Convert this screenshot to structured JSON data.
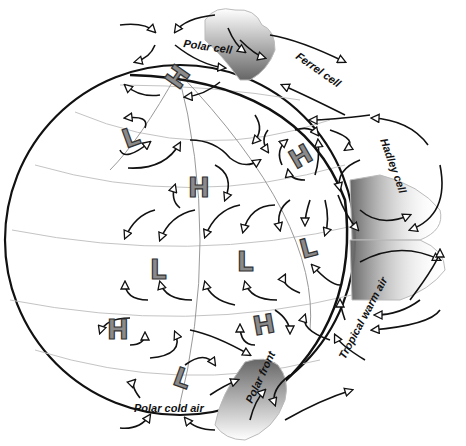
{
  "diagram": {
    "labels": {
      "polar_cell": "Polar cell",
      "ferrel_cell": "Ferrel cell",
      "hadley_cell": "Hadley cell",
      "tropical_warm_air": "Tropical warm air",
      "polar_front": "Polar front",
      "polar_cold_air": "Polar cold air"
    },
    "pressure_systems": [
      {
        "letter": "H",
        "x": 178,
        "y": 78,
        "rotate": -55
      },
      {
        "letter": "L",
        "x": 132,
        "y": 138,
        "rotate": -20
      },
      {
        "letter": "H",
        "x": 198,
        "y": 188,
        "rotate": 0
      },
      {
        "letter": "H",
        "x": 300,
        "y": 157,
        "rotate": -30
      },
      {
        "letter": "L",
        "x": 158,
        "y": 270,
        "rotate": 0
      },
      {
        "letter": "L",
        "x": 245,
        "y": 262,
        "rotate": 0
      },
      {
        "letter": "L",
        "x": 308,
        "y": 248,
        "rotate": -15
      },
      {
        "letter": "H",
        "x": 117,
        "y": 330,
        "rotate": 0
      },
      {
        "letter": "H",
        "x": 263,
        "y": 325,
        "rotate": -10
      },
      {
        "letter": "L",
        "x": 182,
        "y": 378,
        "rotate": 20
      }
    ],
    "colors": {
      "line": "#111111",
      "grid": "#bbbbbb",
      "letter_fill": "#8a8a8a",
      "cloud_shade": "#777777"
    }
  }
}
